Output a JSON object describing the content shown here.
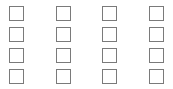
{
  "checkbox_grid": {
    "rows": 4,
    "columns": 4,
    "border_color": "#7a7a7a",
    "items": [
      {
        "row": 1,
        "col": 1,
        "checked": false
      },
      {
        "row": 1,
        "col": 2,
        "checked": false
      },
      {
        "row": 1,
        "col": 3,
        "checked": false
      },
      {
        "row": 1,
        "col": 4,
        "checked": false
      },
      {
        "row": 2,
        "col": 1,
        "checked": false
      },
      {
        "row": 2,
        "col": 2,
        "checked": false
      },
      {
        "row": 2,
        "col": 3,
        "checked": false
      },
      {
        "row": 2,
        "col": 4,
        "checked": false
      },
      {
        "row": 3,
        "col": 1,
        "checked": false
      },
      {
        "row": 3,
        "col": 2,
        "checked": false
      },
      {
        "row": 3,
        "col": 3,
        "checked": false
      },
      {
        "row": 3,
        "col": 4,
        "checked": false
      },
      {
        "row": 4,
        "col": 1,
        "checked": false
      },
      {
        "row": 4,
        "col": 2,
        "checked": false
      },
      {
        "row": 4,
        "col": 3,
        "checked": false
      },
      {
        "row": 4,
        "col": 4,
        "checked": false
      }
    ]
  }
}
